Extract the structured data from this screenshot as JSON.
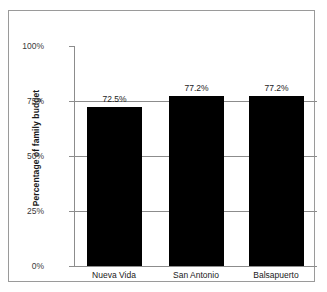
{
  "chart_data": {
    "type": "bar",
    "title": "",
    "subtitle": "",
    "xlabel": "",
    "ylabel": "Percentage of family budget",
    "categories": [
      "Nueva Vida",
      "San Antonio",
      "Balsapuerto"
    ],
    "values": [
      72.5,
      77.2,
      77.2
    ],
    "value_labels": [
      "72.5%",
      "77.2%",
      "77.2%"
    ],
    "ylim": [
      0,
      100
    ],
    "yticks": [
      0,
      25,
      50,
      75,
      100
    ],
    "ytick_labels": [
      "0%",
      "25%",
      "50%",
      "75%",
      "100%"
    ],
    "grid": true,
    "grid_axis": "y",
    "legend": false,
    "legend_position": "none",
    "bar_color": "#000000",
    "axis_color": "#8c8c8c",
    "background_color": "#ffffff",
    "border_color": "#9a9a9a",
    "series": [
      {
        "name": "Percentage of family budget",
        "values": [
          72.5,
          77.2,
          77.2
        ]
      }
    ]
  }
}
